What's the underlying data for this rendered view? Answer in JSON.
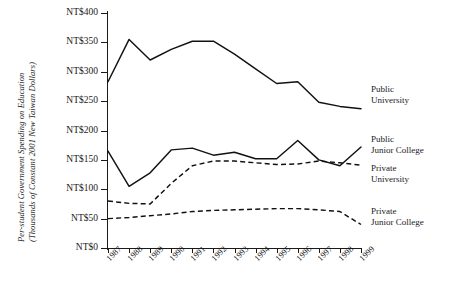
{
  "chart_data": {
    "type": "line",
    "title": "",
    "xlabel": "",
    "ylabel": "Per-student Government Spending on Education (Thousands of Constant 2001 New Taiwan Dollars)",
    "ylabel_line1": "Per-student Government Spending on Education",
    "ylabel_line2": "(Thousands of Constant 2001 New Taiwan Dollars)",
    "categories": [
      "1987",
      "1988",
      "1989",
      "1990",
      "1991",
      "1992",
      "1993",
      "1994",
      "1995",
      "1996",
      "1997",
      "1998",
      "1999"
    ],
    "x": [
      1987,
      1988,
      1989,
      1990,
      1991,
      1992,
      1993,
      1994,
      1995,
      1996,
      1997,
      1998,
      1999
    ],
    "ylim": [
      0,
      400
    ],
    "ytick_values": [
      0,
      50,
      100,
      150,
      200,
      250,
      300,
      350,
      400
    ],
    "ytick_labels": [
      "NT$0",
      "NT$50",
      "NT$100",
      "NT$150",
      "NT$200",
      "NT$250",
      "NT$300",
      "NT$350",
      "NT$400"
    ],
    "grid": false,
    "legend_position": "right-inline-annotations",
    "series": [
      {
        "name": "Public University",
        "label_line1": "Public",
        "label_line2": "University",
        "style": "solid",
        "color": "#111111",
        "values": [
          283,
          355,
          320,
          338,
          352,
          352,
          330,
          305,
          280,
          283,
          248,
          241,
          237
        ]
      },
      {
        "name": "Public Junior College",
        "label_line1": "Public",
        "label_line2": "Junior College",
        "style": "solid",
        "color": "#111111",
        "values": [
          165,
          105,
          128,
          167,
          170,
          158,
          163,
          152,
          152,
          183,
          150,
          140,
          172
        ]
      },
      {
        "name": "Private University",
        "label_line1": "Private",
        "label_line2": "University",
        "style": "dashed",
        "color": "#111111",
        "values": [
          80,
          76,
          75,
          110,
          140,
          148,
          148,
          145,
          142,
          143,
          148,
          145,
          141
        ]
      },
      {
        "name": "Private Junior College",
        "label_line1": "Private",
        "label_line2": "Junior College",
        "style": "dashed",
        "color": "#111111",
        "values": [
          50,
          52,
          55,
          58,
          62,
          64,
          65,
          66,
          67,
          67,
          65,
          62,
          40
        ]
      }
    ]
  }
}
